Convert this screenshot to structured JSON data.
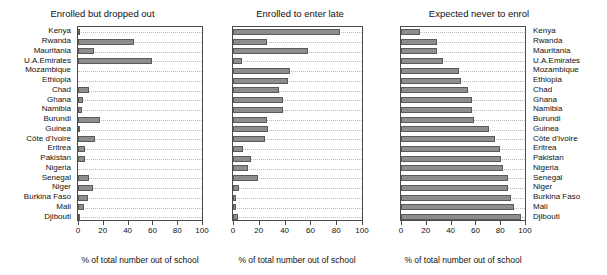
{
  "figure": {
    "xlabel": "% of total number out of school",
    "categories": [
      "Kenya",
      "Rwanda",
      "Mauritania",
      "U.A.Emirates",
      "Mozambique",
      "Ethiopia",
      "Chad",
      "Ghana",
      "Namibia",
      "Burundi",
      "Guinea",
      "Côte d'Ivoire",
      "Eritrea",
      "Pakistan",
      "Nigeria",
      "Senegal",
      "Niger",
      "Burkina Faso",
      "Mali",
      "Djibouti"
    ],
    "xticks": [
      "0",
      "20",
      "40",
      "60",
      "80",
      "100"
    ],
    "bar_color": "#8d8d8d",
    "bar_edge_color": "#5a5a5a",
    "grid_color": "#b9b9b9",
    "axis_color": "#4a4a4a"
  },
  "chart_data": [
    {
      "type": "bar",
      "title": "Enrolled but dropped out",
      "xlabel": "% of total number out of school",
      "ylabel": "",
      "orientation": "horizontal",
      "xlim": [
        0,
        100
      ],
      "grid": true,
      "categories": [
        "Kenya",
        "Rwanda",
        "Mauritania",
        "U.A.Emirates",
        "Mozambique",
        "Ethiopia",
        "Chad",
        "Ghana",
        "Namibia",
        "Burundi",
        "Guinea",
        "Côte d'Ivoire",
        "Eritrea",
        "Pakistan",
        "Nigeria",
        "Senegal",
        "Niger",
        "Burkina Faso",
        "Mali",
        "Djibouti"
      ],
      "values": [
        2,
        45,
        13,
        60,
        0,
        0,
        9,
        4,
        3,
        18,
        2,
        14,
        6,
        6,
        0,
        9,
        12,
        8,
        5,
        1
      ]
    },
    {
      "type": "bar",
      "title": "Enrolled to enter late",
      "xlabel": "% of total number out of school",
      "ylabel": "",
      "orientation": "horizontal",
      "xlim": [
        0,
        100
      ],
      "grid": true,
      "categories": [
        "Kenya",
        "Rwanda",
        "Mauritania",
        "U.A.Emirates",
        "Mozambique",
        "Ethiopia",
        "Chad",
        "Ghana",
        "Namibia",
        "Burundi",
        "Guinea",
        "Côte d'Ivoire",
        "Eritrea",
        "Pakistan",
        "Nigeria",
        "Senegal",
        "Niger",
        "Burkina Faso",
        "Mali",
        "Djibouti"
      ],
      "values": [
        83,
        26,
        58,
        7,
        44,
        43,
        36,
        39,
        39,
        26,
        27,
        25,
        8,
        14,
        12,
        19,
        5,
        2,
        2,
        4
      ]
    },
    {
      "type": "bar",
      "title": "Expected never to enrol",
      "xlabel": "% of total number out of school",
      "ylabel": "",
      "orientation": "horizontal",
      "xlim": [
        0,
        100
      ],
      "grid": true,
      "categories": [
        "Kenya",
        "Rwanda",
        "Mauritania",
        "U.A.Emirates",
        "Mozambique",
        "Ethiopia",
        "Chad",
        "Ghana",
        "Namibia",
        "Burundi",
        "Guinea",
        "Côte d'Ivoire",
        "Eritrea",
        "Pakistan",
        "Nigeria",
        "Senegal",
        "Niger",
        "Burkina Faso",
        "Mali",
        "Djibouti"
      ],
      "values": [
        15,
        29,
        29,
        34,
        47,
        48,
        54,
        57,
        57,
        59,
        71,
        76,
        80,
        81,
        82,
        86,
        86,
        89,
        91,
        97
      ]
    }
  ]
}
